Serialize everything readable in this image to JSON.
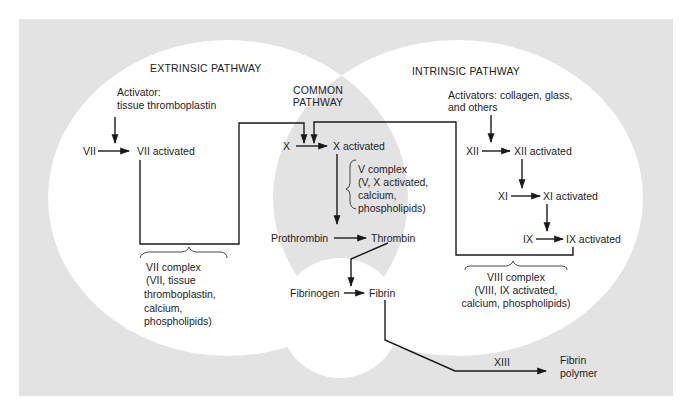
{
  "colors": {
    "background": "#ffffff",
    "panel": "#e3e3e3",
    "circle": "#ffffff",
    "common": "#e3e3e3",
    "line": "#1a1a1a",
    "text": "#1e1e1e"
  },
  "extrinsic": {
    "title": "EXTRINSIC PATHWAY",
    "activator_line1": "Activator:",
    "activator_line2": "tissue thromboplastin",
    "factor": "VII",
    "factor_activated": "VII activated",
    "complex": {
      "line1": "VII complex",
      "line2": "(VII, tissue",
      "line3": "thromboplastin,",
      "line4": "calcium,",
      "line5": "phospholipids)"
    }
  },
  "common": {
    "title_line1": "COMMON",
    "title_line2": "PATHWAY",
    "factor": "X",
    "factor_activated": "X activated",
    "complex": {
      "line1": "V complex",
      "line2": "(V, X activated,",
      "line3": "calcium,",
      "line4": "phospholipids)"
    },
    "prothrombin": "Prothrombin",
    "thrombin": "Thrombin",
    "fibrinogen": "Fibrinogen",
    "fibrin": "Fibrin",
    "xiii": "XIII",
    "fibrin_polymer_line1": "Fibrin",
    "fibrin_polymer_line2": "polymer"
  },
  "intrinsic": {
    "title": "INTRINSIC PATHWAY",
    "activator_line1": "Activators: collagen, glass,",
    "activator_line2": "and others",
    "xii": "XII",
    "xii_activated": "XII activated",
    "xi": "XI",
    "xi_activated": "XI activated",
    "ix": "IX",
    "ix_activated": "IX activated",
    "complex": {
      "line1": "VIII complex",
      "line2": "(VIII, IX activated,",
      "line3": "calcium, phospholipids)"
    }
  }
}
